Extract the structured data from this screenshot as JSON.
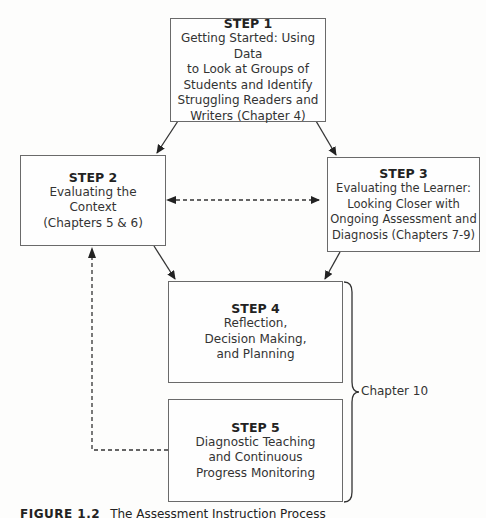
{
  "steps": [
    {
      "title": "STEP 1",
      "text": "Getting Started: Using Data\nto Look at Groups of\nStudents and Identify\nStruggling Readers and\nWriters (Chapter 4)"
    },
    {
      "title": "STEP 2",
      "text": "Evaluating the\nContext\n(Chapters 5 & 6)"
    },
    {
      "title": "STEP 3",
      "text": "Evaluating the Learner:\nLooking Closer with\nOngoing Assessment and\nDiagnosis (Chapters 7-9)"
    },
    {
      "title": "STEP 4",
      "text": "Reflection,\nDecision Making,\nand Planning"
    },
    {
      "title": "STEP 5",
      "text": "Diagnostic Teaching\nand Continuous\nProgress Monitoring"
    }
  ],
  "brace": {
    "label": "Chapter 10"
  },
  "caption": {
    "figure": "FIGURE 1.2",
    "text": "The Assessment Instruction Process"
  },
  "colors": {
    "line": "#333333",
    "box_border": "#6a6a6a"
  }
}
